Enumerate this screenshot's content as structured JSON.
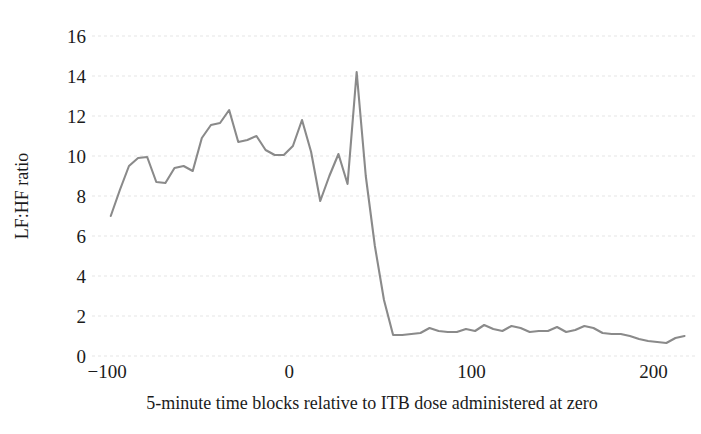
{
  "chart_data": {
    "type": "line",
    "title": "",
    "xlabel": "5-minute time blocks relative to ITB dose administered at zero",
    "ylabel": "LF:HF ratio",
    "xlim": [
      -105,
      220
    ],
    "ylim": [
      0,
      16
    ],
    "xticks": [
      -100,
      0,
      100,
      200
    ],
    "xtick_labels": [
      "−100",
      "0",
      "100",
      "200"
    ],
    "yticks": [
      0,
      2,
      4,
      6,
      8,
      10,
      12,
      14,
      16
    ],
    "ytick_labels": [
      "0",
      "2",
      "4",
      "6",
      "8",
      "10",
      "12",
      "14",
      "16"
    ],
    "grid": "horizontal",
    "legend": "none",
    "series": [
      {
        "name": "LF:HF ratio",
        "color": "#8a8a8a",
        "x": [
          -98,
          -93,
          -88,
          -83,
          -78,
          -73,
          -68,
          -63,
          -58,
          -53,
          -48,
          -43,
          -38,
          -33,
          -28,
          -23,
          -18,
          -13,
          -8,
          -3,
          2,
          7,
          12,
          17,
          22,
          27,
          32,
          37,
          42,
          47,
          52,
          57,
          62,
          67,
          72,
          77,
          82,
          87,
          92,
          97,
          102,
          107,
          112,
          117,
          122,
          127,
          132,
          137,
          142,
          147,
          152,
          157,
          162,
          167,
          172,
          177,
          182,
          187,
          192,
          197,
          202,
          207,
          212,
          217
        ],
        "y": [
          7.0,
          8.3,
          9.5,
          9.9,
          9.95,
          8.7,
          8.65,
          9.4,
          9.5,
          9.25,
          10.9,
          11.55,
          11.65,
          12.3,
          10.7,
          10.8,
          11.0,
          10.3,
          10.05,
          10.05,
          10.5,
          11.8,
          10.2,
          7.75,
          9.0,
          10.1,
          8.6,
          14.2,
          9.0,
          5.5,
          2.8,
          1.05,
          1.05,
          1.1,
          1.15,
          1.4,
          1.25,
          1.2,
          1.2,
          1.35,
          1.25,
          1.55,
          1.35,
          1.25,
          1.5,
          1.4,
          1.2,
          1.25,
          1.25,
          1.45,
          1.2,
          1.3,
          1.5,
          1.4,
          1.15,
          1.1,
          1.1,
          1.0,
          0.85,
          0.75,
          0.7,
          0.65,
          0.9,
          1.0
        ]
      }
    ],
    "colors": {
      "line": "#8a8a8a",
      "grid": "#d9d9d9",
      "text": "#1b1b1b",
      "background": "#ffffff"
    }
  }
}
